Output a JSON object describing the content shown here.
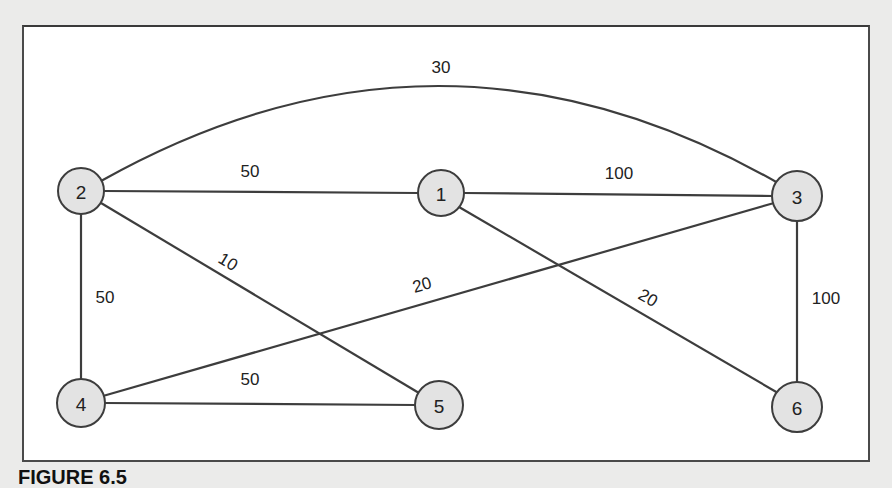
{
  "diagram": {
    "type": "weighted-undirected-graph",
    "nodes": [
      {
        "id": "1",
        "label": "1",
        "x": 441,
        "y": 193
      },
      {
        "id": "2",
        "label": "2",
        "x": 81,
        "y": 191
      },
      {
        "id": "3",
        "label": "3",
        "x": 797,
        "y": 196
      },
      {
        "id": "4",
        "label": "4",
        "x": 81,
        "y": 403
      },
      {
        "id": "5",
        "label": "5",
        "x": 439,
        "y": 405
      },
      {
        "id": "6",
        "label": "6",
        "x": 797,
        "y": 407
      }
    ],
    "edges": [
      {
        "from": "2",
        "to": "3",
        "weight": "30",
        "curved": true
      },
      {
        "from": "2",
        "to": "1",
        "weight": "50"
      },
      {
        "from": "1",
        "to": "3",
        "weight": "100"
      },
      {
        "from": "2",
        "to": "5",
        "weight": "10"
      },
      {
        "from": "2",
        "to": "4",
        "weight": "50"
      },
      {
        "from": "4",
        "to": "3",
        "weight": "20"
      },
      {
        "from": "1",
        "to": "6",
        "weight": "20"
      },
      {
        "from": "3",
        "to": "6",
        "weight": "100"
      },
      {
        "from": "4",
        "to": "5",
        "weight": "50"
      }
    ]
  },
  "caption": {
    "label": "FIGURE 6.5",
    "text": ""
  }
}
